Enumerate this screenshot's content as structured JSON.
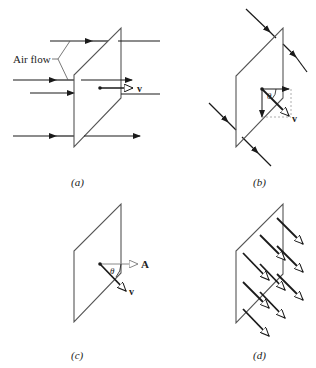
{
  "figure": {
    "panels": [
      {
        "id": "a",
        "caption": "(a)",
        "annotation": "Air flow",
        "vector_label": "v",
        "description": "Flat rectangular surface in a uniform air stream; horizontal flow arrows pass through; velocity vector v drawn from the surface center."
      },
      {
        "id": "b",
        "caption": "(b)",
        "vector_label": "v",
        "angle_label": "θ",
        "description": "Airflow oblique to the surface; v decomposed into components with dashed projections; angle θ shown."
      },
      {
        "id": "c",
        "caption": "(c)",
        "vector_label": "v",
        "area_vector_label": "A",
        "angle_label": "θ",
        "description": "Surface area vector A normal to the surface and velocity v at angle θ."
      },
      {
        "id": "d",
        "caption": "(d)",
        "description": "Many parallel velocity vectors passing through the surface (flux)."
      }
    ]
  },
  "colors": {
    "ink": "#1a1a1a",
    "surface": "#555555",
    "guide": "#999999",
    "background": "#ffffff"
  }
}
